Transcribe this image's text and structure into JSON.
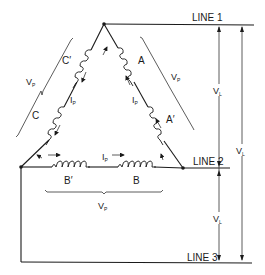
{
  "diagram": {
    "type": "delta-connected three-phase windings",
    "lines": {
      "line1": "LINE 1",
      "line2": "LINE 2",
      "line3": "LINE 3"
    },
    "windings": {
      "a_top": "A",
      "a_bottom": "A′",
      "b_left": "B′",
      "b_right": "B",
      "c_top": "C′",
      "c_bottom": "C"
    },
    "quantities": {
      "phase_voltage": "V",
      "phase_voltage_sub": "P",
      "line_voltage": "V",
      "line_voltage_sub": "L",
      "phase_current": "I",
      "phase_current_sub": "P"
    }
  }
}
